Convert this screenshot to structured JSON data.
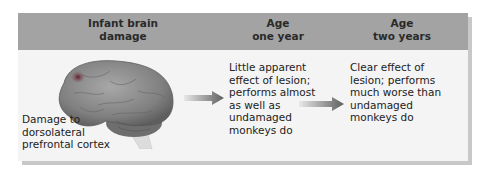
{
  "header": {
    "col1": {
      "line1": "Infant brain",
      "line2": "damage"
    },
    "col2": {
      "line1": "Age",
      "line2": "one year"
    },
    "col3": {
      "line1": "Age",
      "line2": "two years"
    }
  },
  "col1": {
    "illustration": "monkey-brain-lateral-view",
    "caption": [
      "Damage to",
      "dorsolateral",
      "prefrontal cortex"
    ]
  },
  "col2": {
    "text": [
      "Little apparent",
      "effect of lesion;",
      "performs almost",
      "as well as",
      "undamaged",
      "monkeys do"
    ]
  },
  "col3": {
    "text": [
      "Clear effect of",
      "lesion; performs",
      "much worse than",
      "undamaged",
      "monkeys do"
    ]
  },
  "arrows": [
    "right-arrow",
    "right-arrow"
  ],
  "colors": {
    "header_bg": "#a3a3a3",
    "body_bg": "#f4f4f4",
    "shadow": "#c8c8c8",
    "lesion": "#7a2a3a",
    "brain": "#8a8a8a"
  }
}
